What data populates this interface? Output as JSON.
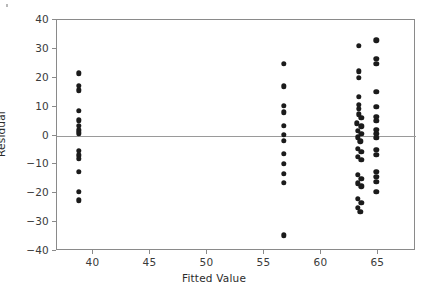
{
  "chart_data": {
    "type": "scatter",
    "title": "",
    "xlabel": "Fitted Value",
    "ylabel": "Residual",
    "xlim": [
      36.8,
      68.3
    ],
    "ylim": [
      -40,
      40
    ],
    "xticks": [
      40,
      45,
      50,
      55,
      60,
      65
    ],
    "xticklabels": [
      "40",
      "45",
      "50",
      "55",
      "60",
      "65"
    ],
    "yticks": [
      40,
      30,
      20,
      10,
      0,
      -10,
      -20,
      -30,
      -40
    ],
    "yticklabels": [
      "40",
      "30",
      "20",
      "10",
      "0",
      "−10",
      "−20",
      "−30",
      "−40"
    ],
    "grid": false,
    "legend": null,
    "reference_lines": [
      {
        "name": "zero-residual-line",
        "orientation": "horizontal",
        "y": 0,
        "color": "#9a9a9a"
      }
    ],
    "marker": {
      "shape": "circle",
      "color": "#1b1b1b",
      "size": 5.4
    },
    "series": [
      {
        "name": "residuals",
        "points": [
          {
            "x": 38.7,
            "y": 21.5
          },
          {
            "x": 38.7,
            "y": 17.3
          },
          {
            "x": 38.7,
            "y": 15.6
          },
          {
            "x": 38.7,
            "y": 8.6
          },
          {
            "x": 38.7,
            "y": 5.2
          },
          {
            "x": 38.7,
            "y": 3.4
          },
          {
            "x": 38.7,
            "y": 1.8
          },
          {
            "x": 38.7,
            "y": 0.7
          },
          {
            "x": 38.7,
            "y": -5.4
          },
          {
            "x": 38.7,
            "y": -6.9
          },
          {
            "x": 38.7,
            "y": -8.0
          },
          {
            "x": 38.7,
            "y": -12.5
          },
          {
            "x": 38.7,
            "y": -19.4
          },
          {
            "x": 38.7,
            "y": -22.4
          },
          {
            "x": 56.7,
            "y": 24.8
          },
          {
            "x": 56.7,
            "y": 17.0
          },
          {
            "x": 56.7,
            "y": 10.2
          },
          {
            "x": 56.7,
            "y": 8.1
          },
          {
            "x": 56.7,
            "y": 3.4
          },
          {
            "x": 56.7,
            "y": 0.3
          },
          {
            "x": 56.7,
            "y": -1.9
          },
          {
            "x": 56.7,
            "y": -6.3
          },
          {
            "x": 56.7,
            "y": -9.7
          },
          {
            "x": 56.7,
            "y": -13.2
          },
          {
            "x": 56.7,
            "y": -16.4
          },
          {
            "x": 56.7,
            "y": -34.6
          },
          {
            "x": 63.3,
            "y": 31.0
          },
          {
            "x": 63.3,
            "y": 22.2
          },
          {
            "x": 63.3,
            "y": 20.0
          },
          {
            "x": 63.3,
            "y": 13.5
          },
          {
            "x": 63.3,
            "y": 10.6
          },
          {
            "x": 63.3,
            "y": 9.2
          },
          {
            "x": 63.3,
            "y": 7.4
          },
          {
            "x": 63.5,
            "y": 6.1
          },
          {
            "x": 63.1,
            "y": 4.2
          },
          {
            "x": 63.5,
            "y": 3.2
          },
          {
            "x": 63.2,
            "y": 1.6
          },
          {
            "x": 63.5,
            "y": 0.6
          },
          {
            "x": 63.2,
            "y": -0.6
          },
          {
            "x": 63.4,
            "y": -2.0
          },
          {
            "x": 63.2,
            "y": -4.6
          },
          {
            "x": 63.5,
            "y": -5.6
          },
          {
            "x": 63.2,
            "y": -7.4
          },
          {
            "x": 63.5,
            "y": -8.4
          },
          {
            "x": 63.2,
            "y": -13.6
          },
          {
            "x": 63.5,
            "y": -15.0
          },
          {
            "x": 63.2,
            "y": -16.6
          },
          {
            "x": 63.5,
            "y": -17.6
          },
          {
            "x": 63.2,
            "y": -22.0
          },
          {
            "x": 63.5,
            "y": -23.4
          },
          {
            "x": 63.2,
            "y": -25.0
          },
          {
            "x": 63.4,
            "y": -26.4
          },
          {
            "x": 64.8,
            "y": 33.0
          },
          {
            "x": 64.8,
            "y": 26.5
          },
          {
            "x": 64.8,
            "y": 24.8
          },
          {
            "x": 64.8,
            "y": 15.2
          },
          {
            "x": 64.8,
            "y": 10.0
          },
          {
            "x": 64.8,
            "y": 6.4
          },
          {
            "x": 64.8,
            "y": 5.0
          },
          {
            "x": 64.8,
            "y": 2.0
          },
          {
            "x": 64.8,
            "y": 0.6
          },
          {
            "x": 64.8,
            "y": -0.8
          },
          {
            "x": 64.8,
            "y": -5.0
          },
          {
            "x": 64.8,
            "y": -6.6
          },
          {
            "x": 64.8,
            "y": -12.6
          },
          {
            "x": 64.8,
            "y": -14.2
          },
          {
            "x": 64.8,
            "y": -16.0
          },
          {
            "x": 64.8,
            "y": -19.6
          }
        ]
      }
    ]
  }
}
